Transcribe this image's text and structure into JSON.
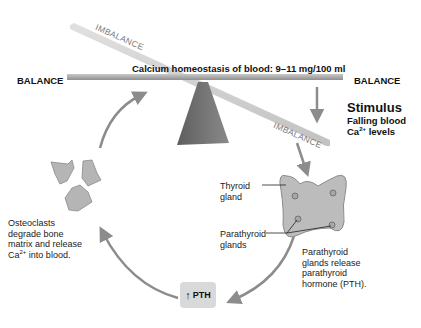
{
  "diagram": {
    "title": "Calcium homeostasis of blood: 9–11 mg/100 ml",
    "seesaw": {
      "left_label": "BALANCE",
      "right_label": "BALANCE",
      "imbalance_upper": "IMBALANCE",
      "imbalance_lower": "IMBALANCE"
    },
    "stimulus": {
      "heading": "Stimulus",
      "line1": "Falling blood",
      "line2_prefix": "Ca",
      "line2_sup": "2+",
      "line2_suffix": " levels"
    },
    "thyroid": {
      "thyroid_label_1": "Thyroid",
      "thyroid_label_2": "gland",
      "parathyroid_label_1": "Parathyroid",
      "parathyroid_label_2": "glands",
      "release_1": "Parathyroid",
      "release_2": "glands release",
      "release_3": "parathyroid",
      "release_4": "hormone (PTH)."
    },
    "pth_box": {
      "arrow": "↑",
      "label": "PTH"
    },
    "osteoclasts": {
      "line1": "Osteoclasts",
      "line2": "degrade bone",
      "line3": "matrix and release",
      "line4_prefix": "Ca",
      "line4_sup": "2+",
      "line4_suffix": " into blood."
    },
    "colors": {
      "beam": "#a8a8a8",
      "fulcrum": "#6e6e6e",
      "arrow": "#8c8c8c",
      "gland": "#bcbcbc",
      "pth_box": "#d9d9d9"
    }
  }
}
